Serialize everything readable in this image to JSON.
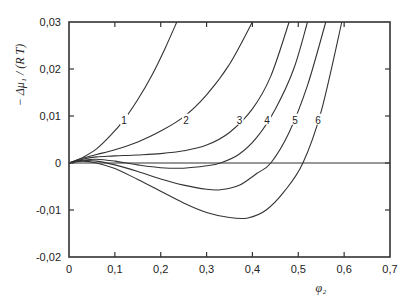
{
  "chart_data": {
    "type": "line",
    "title": "",
    "xlabel": "φ₂",
    "ylabel": "− Δμ₁ / (R T)",
    "xlim": [
      0,
      0.7
    ],
    "ylim": [
      -0.02,
      0.03
    ],
    "grid": false,
    "legend": "inline curve labels 1–6",
    "x_ticks": [
      0,
      0.1,
      0.2,
      0.3,
      0.4,
      0.5,
      0.6,
      0.7
    ],
    "x_tick_labels": [
      "0",
      "0,1",
      "0,2",
      "0,3",
      "0,4",
      "0,5",
      "0,6",
      "0,7"
    ],
    "y_ticks": [
      -0.02,
      -0.01,
      0,
      0.01,
      0.02,
      0.03
    ],
    "y_tick_labels": [
      "-0,02",
      "-0,01",
      "0",
      "0,01",
      "0,02",
      "0,03"
    ],
    "reference_line": {
      "y": 0
    },
    "series": [
      {
        "name": "1",
        "label_pos": [
          0.12,
          0.009
        ],
        "x": [
          0,
          0.03,
          0.06,
          0.09,
          0.12,
          0.15,
          0.18,
          0.21,
          0.235
        ],
        "y": [
          0,
          0.0012,
          0.003,
          0.0058,
          0.0092,
          0.0135,
          0.0185,
          0.0245,
          0.03
        ]
      },
      {
        "name": "2",
        "label_pos": [
          0.255,
          0.009
        ],
        "x": [
          0,
          0.03,
          0.06,
          0.1,
          0.15,
          0.2,
          0.25,
          0.3,
          0.35,
          0.4
        ],
        "y": [
          0,
          0.001,
          0.0018,
          0.0028,
          0.0045,
          0.0068,
          0.0098,
          0.0145,
          0.021,
          0.03
        ]
      },
      {
        "name": "3",
        "label_pos": [
          0.372,
          0.009
        ],
        "x": [
          0,
          0.03,
          0.06,
          0.1,
          0.15,
          0.2,
          0.25,
          0.3,
          0.35,
          0.4,
          0.44,
          0.48
        ],
        "y": [
          0,
          0.0008,
          0.0013,
          0.0015,
          0.0017,
          0.002,
          0.0026,
          0.0038,
          0.0065,
          0.0115,
          0.0185,
          0.03
        ]
      },
      {
        "name": "4",
        "label_pos": [
          0.432,
          0.009
        ],
        "x": [
          0,
          0.03,
          0.06,
          0.1,
          0.15,
          0.2,
          0.25,
          0.3,
          0.33,
          0.37,
          0.41,
          0.45,
          0.49,
          0.52
        ],
        "y": [
          0,
          0.0006,
          0.0008,
          0.0004,
          -0.0004,
          -0.001,
          -0.0011,
          -0.0006,
          0.0,
          0.0018,
          0.0055,
          0.0115,
          0.02,
          0.03
        ]
      },
      {
        "name": "5",
        "label_pos": [
          0.493,
          0.009
        ],
        "x": [
          0,
          0.03,
          0.06,
          0.1,
          0.15,
          0.2,
          0.25,
          0.3,
          0.33,
          0.37,
          0.41,
          0.44,
          0.48,
          0.52,
          0.56
        ],
        "y": [
          0,
          0.0005,
          0.0004,
          -0.0004,
          -0.0018,
          -0.0034,
          -0.0047,
          -0.0056,
          -0.0057,
          -0.0048,
          -0.0022,
          0.0,
          0.0065,
          0.0165,
          0.03
        ]
      },
      {
        "name": "6",
        "label_pos": [
          0.543,
          0.009
        ],
        "x": [
          0,
          0.03,
          0.06,
          0.1,
          0.15,
          0.2,
          0.25,
          0.3,
          0.35,
          0.39,
          0.43,
          0.47,
          0.51,
          0.55,
          0.595
        ],
        "y": [
          0,
          0.0004,
          0.0,
          -0.0012,
          -0.0035,
          -0.006,
          -0.0085,
          -0.0105,
          -0.0116,
          -0.0117,
          -0.01,
          -0.006,
          0.0,
          0.011,
          0.03
        ]
      }
    ]
  },
  "colors": {
    "axis": "#333333",
    "curve": "#333333",
    "background": "#ffffff"
  }
}
